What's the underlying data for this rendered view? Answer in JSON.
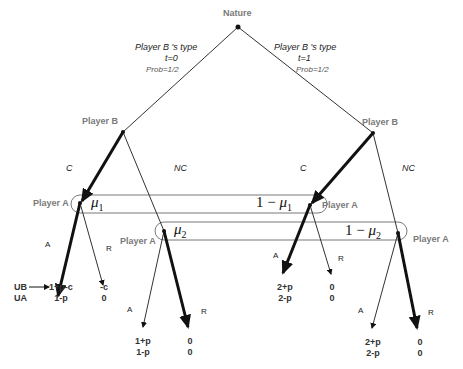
{
  "diagram": {
    "type": "extensive-form game tree",
    "nature": {
      "label": "Nature"
    },
    "nature_branches": [
      {
        "label": "Player B 's type",
        "type_value": "t=0",
        "prob": "Prob=1/2"
      },
      {
        "label": "Player B 's type",
        "type_value": "t=1",
        "prob": "Prob=1/2"
      }
    ],
    "player_b_nodes": [
      {
        "label": "Player B",
        "actions": [
          "C",
          "NC"
        ]
      },
      {
        "label": "Player B",
        "actions": [
          "C",
          "NC"
        ]
      }
    ],
    "player_a_nodes": [
      {
        "label": "Player A"
      },
      {
        "label": "Player A"
      },
      {
        "label": "Player A"
      },
      {
        "label": "Player A"
      }
    ],
    "beliefs": {
      "mu1": {
        "symbol": "μ",
        "sub": "1",
        "complement": "1 − "
      },
      "mu2": {
        "symbol": "μ",
        "sub": "2",
        "complement": "1 − "
      }
    },
    "actions_a": {
      "accept": "A",
      "reject": "R"
    },
    "payoff_legend": {
      "ub": "UB",
      "ua": "UA"
    },
    "payoffs": [
      {
        "ub": "1+p-c",
        "ua": "1-p"
      },
      {
        "ub": "-c",
        "ua": "0"
      },
      {
        "ub": "1+p",
        "ua": "1-p"
      },
      {
        "ub": "0",
        "ua": "0"
      },
      {
        "ub": "2+p",
        "ua": "2-p"
      },
      {
        "ub": "0",
        "ua": "0"
      },
      {
        "ub": "2+p",
        "ua": "2-p"
      },
      {
        "ub": "0",
        "ua": "0"
      }
    ]
  }
}
